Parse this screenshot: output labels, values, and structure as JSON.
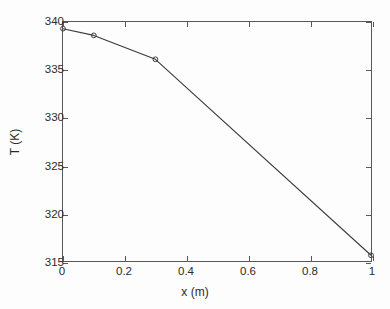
{
  "chart_data": {
    "type": "line",
    "title": "",
    "xlabel": "x (m)",
    "ylabel": "T (K)",
    "xlim": [
      0,
      1
    ],
    "ylim": [
      315,
      340
    ],
    "grid": false,
    "legend": null,
    "xticks": [
      0,
      0.2,
      0.4,
      0.6,
      0.8,
      1
    ],
    "xticklabels": [
      "0",
      "0.2",
      "0.4",
      "0.6",
      "0.8",
      "1"
    ],
    "yticks": [
      315,
      320,
      325,
      330,
      335,
      340
    ],
    "yticklabels": [
      "315",
      "320",
      "325",
      "330",
      "335",
      "340"
    ],
    "series": [
      {
        "name": "T",
        "marker": "circle",
        "line_color": "#3a3a3a",
        "marker_color": "#3a3a3a",
        "x": [
          0,
          0.1,
          0.3,
          1
        ],
        "y": [
          339.3,
          338.6,
          336.1,
          315.6
        ]
      }
    ],
    "colors": {
      "line": "#3a3a3a",
      "axis": "#585858",
      "text": "#2b2b2b",
      "background": "#fdfdfd"
    }
  }
}
